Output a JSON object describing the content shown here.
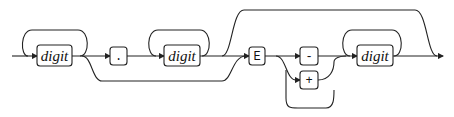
{
  "diagram": {
    "type": "railroad-syntax-diagram",
    "nodes": [
      {
        "id": "digit1",
        "kind": "nonterminal",
        "label": "digit",
        "repeatable": true
      },
      {
        "id": "dot",
        "kind": "terminal",
        "label": "."
      },
      {
        "id": "digit2",
        "kind": "nonterminal",
        "label": "digit",
        "repeatable": true
      },
      {
        "id": "E",
        "kind": "terminal",
        "label": "E"
      },
      {
        "id": "minus",
        "kind": "terminal",
        "label": "-"
      },
      {
        "id": "plus",
        "kind": "terminal",
        "label": "+"
      },
      {
        "id": "digit3",
        "kind": "nonterminal",
        "label": "digit",
        "repeatable": true
      }
    ],
    "edges": [
      [
        "start",
        "digit1"
      ],
      [
        "digit1",
        "dot"
      ],
      [
        "dot",
        "digit2"
      ],
      [
        "digit1",
        "E"
      ],
      [
        "digit2",
        "E"
      ],
      [
        "digit2",
        "end"
      ],
      [
        "digit1",
        "end"
      ],
      [
        "E",
        "minus"
      ],
      [
        "E",
        "plus"
      ],
      [
        "E",
        "digit3"
      ],
      [
        "minus",
        "digit3"
      ],
      [
        "plus",
        "digit3"
      ],
      [
        "digit3",
        "end"
      ]
    ]
  }
}
